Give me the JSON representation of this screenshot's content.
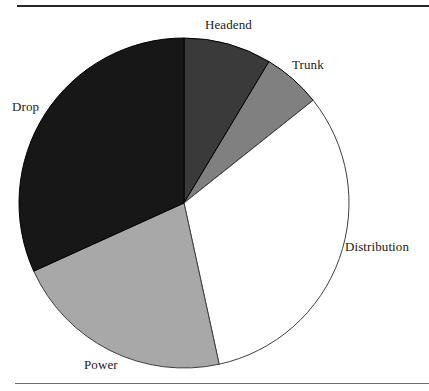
{
  "figure": {
    "background_color": "#ffffff",
    "top_rule_color": "#262626",
    "bottom_rule_color": "#6d6d6d"
  },
  "chart_data": {
    "type": "pie",
    "title": "",
    "subtitle": "",
    "xlabel": "",
    "ylabel": "",
    "legend_position": "none",
    "grid": false,
    "labels_outside": true,
    "start_angle_deg": 0,
    "direction": "clockwise",
    "center": {
      "x": 184,
      "y": 203
    },
    "radius": 165,
    "categories": [
      "Headend",
      "Trunk",
      "Distribution",
      "Power",
      "Drop"
    ],
    "values": [
      8.6,
      5.7,
      32.3,
      21.6,
      31.8
    ],
    "units": "percent",
    "colors": [
      "#3a3a3a",
      "#808080",
      "#ffffff",
      "#a8a8a8",
      "#171717"
    ],
    "slices": [
      {
        "label": "Headend",
        "value": 8.6,
        "start_deg": 0.0,
        "end_deg": 31.0,
        "color": "#3a3a3a",
        "outline": "#000000"
      },
      {
        "label": "Trunk",
        "value": 5.7,
        "start_deg": 31.0,
        "end_deg": 51.5,
        "color": "#808080",
        "outline": "#000000"
      },
      {
        "label": "Distribution",
        "value": 32.3,
        "start_deg": 51.5,
        "end_deg": 167.7,
        "color": "#ffffff",
        "outline": "#3f3f3f"
      },
      {
        "label": "Power",
        "value": 21.6,
        "start_deg": 167.7,
        "end_deg": 245.6,
        "color": "#a8a8a8",
        "outline": "#3f3f3f"
      },
      {
        "label": "Drop",
        "value": 31.8,
        "start_deg": 245.6,
        "end_deg": 360.0,
        "color": "#171717",
        "outline": "#000000"
      }
    ]
  },
  "labels": {
    "headend": "Headend",
    "trunk": "Trunk",
    "distribution": "Distribution",
    "power": "Power",
    "drop": "Drop"
  }
}
